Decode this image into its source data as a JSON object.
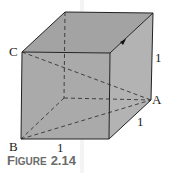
{
  "figure": {
    "caption_prefix_first": "F",
    "caption_prefix_rest": "IGURE",
    "caption_number": "2.14",
    "vertex_labels": {
      "C": "C",
      "A": "A",
      "B": "B"
    },
    "edge_labels": {
      "right_vertical": "1",
      "depth_bottom_right": "1",
      "bottom_front": "1"
    }
  },
  "colors": {
    "front_face": "#a9a9a9",
    "top_face": "#a2a2a2",
    "right_face": "#b4b4b4",
    "edge": "#222222",
    "caption": "#6b6b6b"
  }
}
